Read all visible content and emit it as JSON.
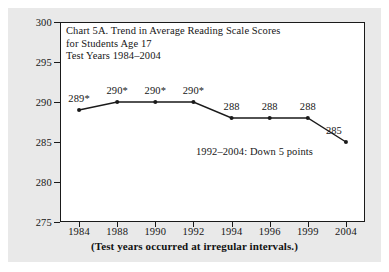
{
  "chart_data": {
    "type": "line",
    "title": "Chart 5A. Trend in Average Reading Scale Scores\nfor Students Age 17\nTest Years 1984–2004",
    "title_lines": [
      "Chart 5A. Trend in Average Reading Scale Scores",
      "for Students Age 17",
      "Test Years 1984–2004"
    ],
    "xlabel": "",
    "ylabel": "",
    "categories": [
      "1984",
      "1988",
      "1990",
      "1992",
      "1994",
      "1996",
      "1999",
      "2004"
    ],
    "values": [
      289,
      290,
      290,
      290,
      288,
      288,
      288,
      285
    ],
    "point_labels": [
      "289*",
      "290*",
      "290*",
      "290*",
      "288",
      "288",
      "288",
      "285"
    ],
    "ylim": [
      275,
      300
    ],
    "yticks": [
      275,
      280,
      285,
      290,
      295,
      300
    ],
    "ytick_labels": [
      "275",
      "280",
      "285",
      "290",
      "295",
      "300"
    ],
    "grid": false,
    "legend": "none",
    "annotations": [
      "1992–2004: Down 5 points"
    ],
    "footnote": "(Test years occurred at irregular intervals.)",
    "series_color": "#1a1a1a",
    "marker": "circle",
    "axis_note": "x axis is categorical; test years occurred at irregular intervals"
  },
  "colors": {
    "page_background": "#ffffff",
    "panel_background": "#e9e9e9",
    "plot_background": "#ffffff",
    "axis": "#1a1a1a",
    "text": "#161616",
    "series": "#1a1a1a"
  }
}
